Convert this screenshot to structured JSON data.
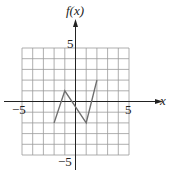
{
  "chart_data": {
    "type": "line",
    "title": "",
    "xlabel": "x",
    "ylabel": "f(x)",
    "xlim": [
      -5,
      5
    ],
    "ylim": [
      -5,
      5
    ],
    "grid": true,
    "tick_labels": {
      "x": [
        "-5",
        "5"
      ],
      "y": [
        "5",
        "-5"
      ]
    },
    "series": [
      {
        "name": "f(x)",
        "x": [
          -2,
          -1,
          1,
          2
        ],
        "y": [
          -2,
          1,
          -2,
          2
        ]
      }
    ],
    "colors": {
      "grid": "#9a9a9a",
      "axis": "#222222",
      "line": "#6e6e6e"
    }
  },
  "labels": {
    "y_axis": "f(x)",
    "x_axis": "x",
    "x_min": "−5",
    "x_max": "5",
    "y_max": "5",
    "y_min": "−5"
  }
}
